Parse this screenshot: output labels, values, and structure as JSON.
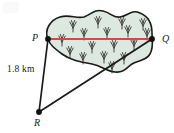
{
  "figure": {
    "type": "geometry-diagram",
    "background_color": "#ffffff"
  },
  "labels": {
    "p": "P",
    "q": "Q",
    "r": "R",
    "distance_pr": "1.8 km"
  },
  "colors": {
    "marsh_fill": "#dde8e0",
    "outline": "#1a1a1a",
    "segment_pq": "#d04a4a",
    "text": "#1a1a1a"
  },
  "points": [
    {
      "name": "P",
      "x": 48,
      "y": 39
    },
    {
      "name": "Q",
      "x": 152,
      "y": 39
    },
    {
      "name": "R",
      "x": 39,
      "y": 112
    }
  ],
  "segments": [
    {
      "name": "PQ",
      "from": "P",
      "to": "Q",
      "color": "#d04a4a",
      "label": ""
    },
    {
      "name": "PR",
      "from": "P",
      "to": "R",
      "color": "#1a1a1a",
      "label": "1.8 km"
    },
    {
      "name": "RQ",
      "from": "R",
      "to": "Q",
      "color": "#1a1a1a",
      "label": ""
    }
  ],
  "marsh_symbols": {
    "count": 17,
    "glyph": "grass-tuft",
    "positions": [
      [
        73,
        26
      ],
      [
        98,
        22
      ],
      [
        122,
        23
      ],
      [
        143,
        24
      ],
      [
        62,
        40
      ],
      [
        84,
        34
      ],
      [
        107,
        33
      ],
      [
        128,
        31
      ],
      [
        147,
        34
      ],
      [
        70,
        52
      ],
      [
        92,
        47
      ],
      [
        114,
        46
      ],
      [
        134,
        44
      ],
      [
        83,
        58
      ],
      [
        104,
        57
      ],
      [
        124,
        58
      ],
      [
        112,
        66
      ]
    ]
  }
}
